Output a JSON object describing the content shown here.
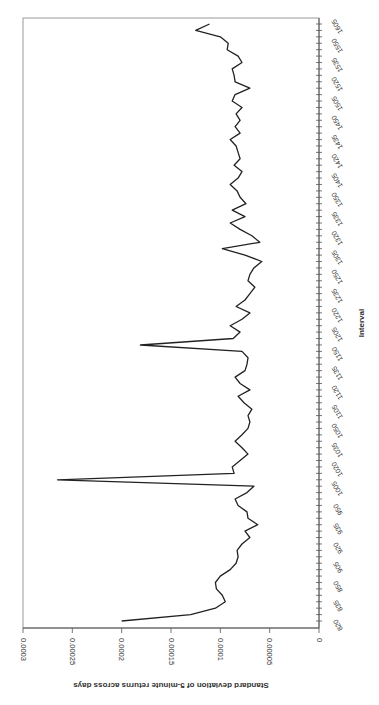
{
  "chart_data": {
    "type": "line",
    "orientation": "rotated-90-clockwise",
    "title": "",
    "xlabel": "Interval",
    "ylabel": "Standard deviation of 5-minute returns across days",
    "ylim": [
      0,
      0.0003
    ],
    "yticks": [
      "0",
      "0.00005",
      "0.0001",
      "0.00015",
      "0.0002",
      "0.00025",
      "0.0003"
    ],
    "grid": false,
    "legend": null,
    "xtick_labels": [
      "820",
      "835",
      "850",
      "905",
      "920",
      "935",
      "950",
      "1005",
      "1020",
      "1035",
      "1050",
      "1105",
      "1120",
      "1135",
      "1150",
      "1205",
      "1220",
      "1235",
      "1250",
      "1305",
      "1320",
      "1335",
      "1350",
      "1405",
      "1420",
      "1435",
      "1450",
      "1505",
      "1520",
      "1535",
      "1550",
      "1605"
    ],
    "series": [
      {
        "name": "Std dev of 5-minute returns",
        "color": "#222222",
        "x": [
          "820",
          "825",
          "830",
          "835",
          "840",
          "845",
          "850",
          "855",
          "900",
          "905",
          "910",
          "915",
          "920",
          "925",
          "930",
          "935",
          "940",
          "945",
          "950",
          "955",
          "1000",
          "1005",
          "1010",
          "1015",
          "1020",
          "1025",
          "1030",
          "1035",
          "1040",
          "1045",
          "1050",
          "1055",
          "1100",
          "1105",
          "1110",
          "1115",
          "1120",
          "1125",
          "1130",
          "1135",
          "1140",
          "1145",
          "1150",
          "1155",
          "1200",
          "1205",
          "1210",
          "1215",
          "1220",
          "1225",
          "1230",
          "1235",
          "1240",
          "1245",
          "1250",
          "1255",
          "1300",
          "1305",
          "1310",
          "1315",
          "1320",
          "1325",
          "1330",
          "1335",
          "1340",
          "1345",
          "1350",
          "1355",
          "1400",
          "1405",
          "1410",
          "1415",
          "1420",
          "1425",
          "1430",
          "1435",
          "1440",
          "1445",
          "1450",
          "1455",
          "1500",
          "1505",
          "1510",
          "1515",
          "1520",
          "1525",
          "1530",
          "1535",
          "1540",
          "1545",
          "1550",
          "1555",
          "1600",
          "1605"
        ],
        "values": [
          0.0002,
          0.00013,
          0.000105,
          9.5e-05,
          9.8e-05,
          0.000104,
          0.000105,
          0.0001,
          9e-05,
          8.4e-05,
          8.2e-05,
          8.3e-05,
          7.8e-05,
          7e-05,
          7.5e-05,
          6.2e-05,
          7.2e-05,
          7.3e-05,
          8.2e-05,
          8.5e-05,
          7.3e-05,
          6.6e-05,
          0.000265,
          8.6e-05,
          8.8e-05,
          8e-05,
          7.2e-05,
          7.8e-05,
          8.5e-05,
          7.8e-05,
          7.2e-05,
          7e-05,
          7.2e-05,
          6.8e-05,
          7.6e-05,
          8.2e-05,
          7e-05,
          8e-05,
          8.5e-05,
          7.5e-05,
          7.3e-05,
          7.2e-05,
          7.8e-05,
          0.000181,
          8.7e-05,
          8e-05,
          9e-05,
          7.8e-05,
          7e-05,
          8.4e-05,
          7.5e-05,
          7e-05,
          6.5e-05,
          7.2e-05,
          7e-05,
          6.6e-05,
          5.8e-05,
          7.5e-05,
          9.8e-05,
          6e-05,
          6.8e-05,
          8e-05,
          9e-05,
          7.5e-05,
          8.8e-05,
          7.4e-05,
          8e-05,
          8.3e-05,
          9e-05,
          8.2e-05,
          7.8e-05,
          8.6e-05,
          8e-05,
          8.2e-05,
          8.4e-05,
          9e-05,
          8e-05,
          8.5e-05,
          8e-05,
          8.4e-05,
          7.8e-05,
          8.8e-05,
          8.5e-05,
          7e-05,
          8.5e-05,
          8.6e-05,
          8.8e-05,
          7.8e-05,
          8.2e-05,
          9.3e-05,
          9.2e-05,
          0.0001,
          0.000125,
          0.000111
        ]
      }
    ]
  }
}
